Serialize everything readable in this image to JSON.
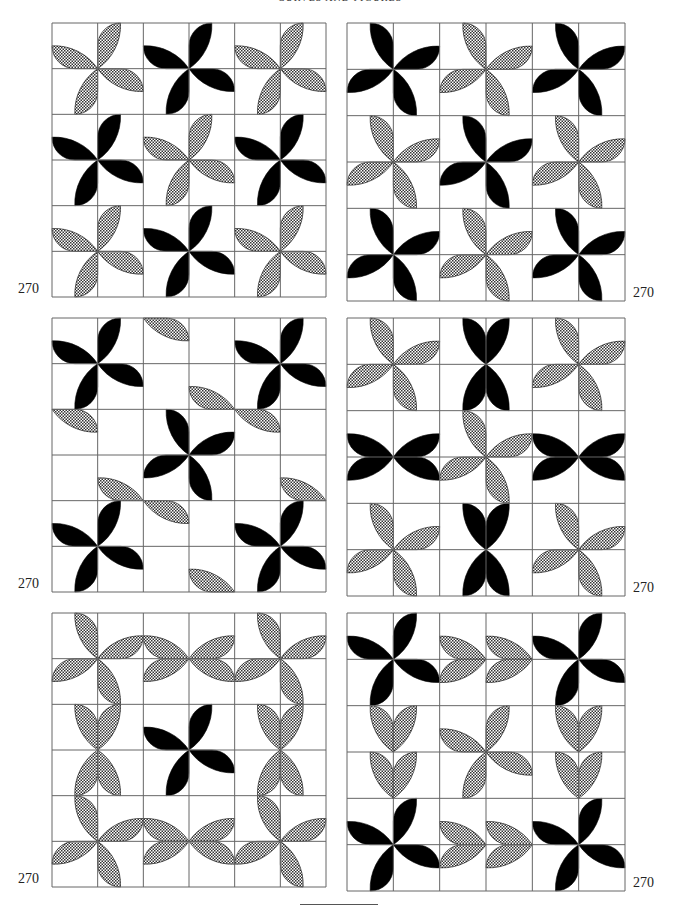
{
  "header": {
    "title": "CURVES AND FIGURES"
  },
  "colors": {
    "ink": "#000000",
    "grid": "#666666",
    "hatch_bg": "#ffffff",
    "hatch_fg": "#333333"
  },
  "figure_number": "270",
  "panels": [
    {
      "id": "p1",
      "x": 52,
      "y": 23,
      "size": 274,
      "label": "270",
      "label_side": "left",
      "blocks": [
        [
          "R",
          "h"
        ],
        [
          "R",
          "b"
        ],
        [
          "R",
          "h"
        ],
        [
          "R",
          "b"
        ],
        [
          "R",
          "h"
        ],
        [
          "R",
          "b"
        ],
        [
          "R",
          "h"
        ],
        [
          "R",
          "b"
        ],
        [
          "R",
          "h"
        ]
      ]
    },
    {
      "id": "p2",
      "x": 347,
      "y": 23,
      "size": 278,
      "label": "270",
      "label_side": "right",
      "blocks": [
        [
          "L",
          "b"
        ],
        [
          "L",
          "h"
        ],
        [
          "L",
          "b"
        ],
        [
          "L",
          "h"
        ],
        [
          "L",
          "b"
        ],
        [
          "L",
          "h"
        ],
        [
          "L",
          "b"
        ],
        [
          "L",
          "h"
        ],
        [
          "L",
          "b"
        ]
      ]
    },
    {
      "id": "p3",
      "x": 52,
      "y": 318,
      "size": 274,
      "label": "270",
      "label_side": "left",
      "blocks": [
        [
          "R",
          "b"
        ],
        [
          "X",
          "h"
        ],
        [
          "R",
          "b"
        ],
        [
          "X",
          "h"
        ],
        [
          "L",
          "b"
        ],
        [
          "X",
          "h"
        ],
        [
          "R",
          "b"
        ],
        [
          "X",
          "h"
        ],
        [
          "R",
          "b"
        ]
      ]
    },
    {
      "id": "p4",
      "x": 347,
      "y": 318,
      "size": 278,
      "label": "270",
      "label_side": "right",
      "blocks": [
        [
          "L",
          "h"
        ],
        [
          "BH",
          "b"
        ],
        [
          "L",
          "h"
        ],
        [
          "BV",
          "b"
        ],
        [
          "L",
          "h"
        ],
        [
          "BV",
          "b"
        ],
        [
          "L",
          "h"
        ],
        [
          "BH",
          "b"
        ],
        [
          "L",
          "h"
        ]
      ]
    },
    {
      "id": "p5",
      "x": 52,
      "y": 613,
      "size": 274,
      "label": "270",
      "label_side": "left",
      "blocks": [
        [
          "L",
          "h"
        ],
        [
          "EH",
          "h"
        ],
        [
          "L",
          "h"
        ],
        [
          "EV",
          "h"
        ],
        [
          "R",
          "b"
        ],
        [
          "EV",
          "h"
        ],
        [
          "L",
          "h"
        ],
        [
          "EH",
          "h"
        ],
        [
          "L",
          "h"
        ]
      ]
    },
    {
      "id": "p6",
      "x": 347,
      "y": 613,
      "size": 278,
      "label": "270",
      "label_side": "right",
      "blocks": [
        [
          "R",
          "b"
        ],
        [
          "SH",
          "h"
        ],
        [
          "R",
          "b"
        ],
        [
          "SV",
          "h"
        ],
        [
          "R",
          "h"
        ],
        [
          "SV",
          "h"
        ],
        [
          "R",
          "b"
        ],
        [
          "SH",
          "h"
        ],
        [
          "R",
          "b"
        ]
      ]
    }
  ]
}
